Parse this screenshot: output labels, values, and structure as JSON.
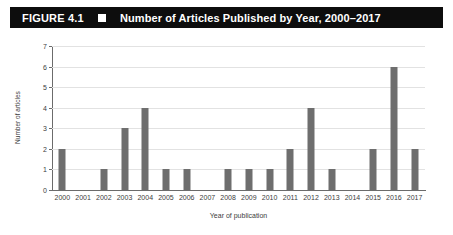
{
  "header": {
    "figure_number": "FIGURE 4.1",
    "marker_icon": "black-square-marker",
    "title": "Number of Articles Published by Year, 2000–2017",
    "background_color": "#0d0d0d",
    "text_color": "#ffffff"
  },
  "chart_data": {
    "type": "bar",
    "title": "Number of Articles Published by Year, 2000–2017",
    "xlabel": "Year of publication",
    "ylabel": "Number of articles",
    "categories": [
      "2000",
      "2001",
      "2002",
      "2003",
      "2004",
      "2005",
      "2006",
      "2007",
      "2008",
      "2009",
      "2010",
      "2011",
      "2012",
      "2013",
      "2014",
      "2015",
      "2016",
      "2017"
    ],
    "values": [
      2,
      0,
      1,
      3,
      4,
      1,
      1,
      0,
      1,
      1,
      1,
      2,
      4,
      1,
      0,
      2,
      6,
      2
    ],
    "ylim": [
      0,
      7
    ],
    "ytick_labels": [
      "0",
      "1",
      "2",
      "3",
      "4",
      "5",
      "6",
      "7"
    ],
    "ytick_values": [
      0,
      1,
      2,
      3,
      4,
      5,
      6,
      7
    ],
    "grid": "horizontal",
    "legend": "none",
    "bar_color": "#6e6e6e",
    "gridline_color": "#e2e2e2",
    "axis_color": "#6b6b6b"
  }
}
